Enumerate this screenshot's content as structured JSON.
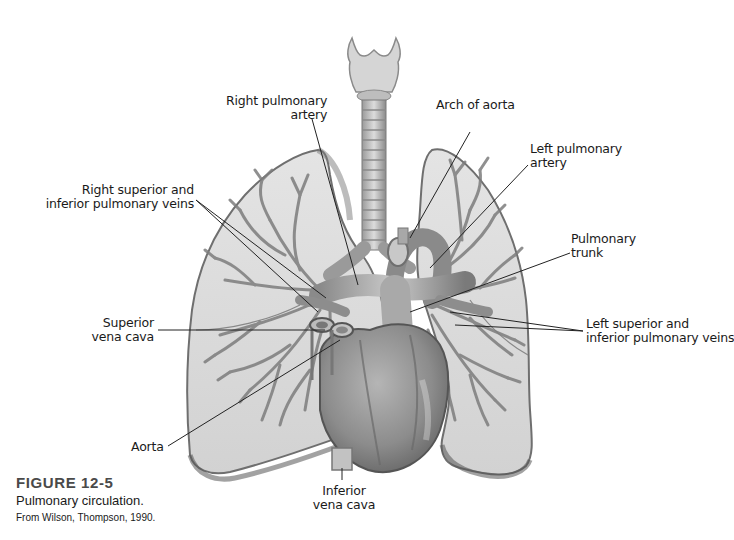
{
  "figure": {
    "number": "FIGURE 12-5",
    "title": "Pulmonary circulation.",
    "credit": "From Wilson, Thompson, 1990."
  },
  "labels": {
    "right_pulmonary_artery": {
      "line1": "Right pulmonary",
      "line2": "artery"
    },
    "arch_of_aorta": {
      "line1": "Arch of aorta"
    },
    "left_pulmonary_artery": {
      "line1": "Left pulmonary",
      "line2": "artery"
    },
    "right_pulmonary_veins": {
      "line1": "Right superior and",
      "line2": "inferior pulmonary veins"
    },
    "pulmonary_trunk": {
      "line1": "Pulmonary",
      "line2": "trunk"
    },
    "superior_vena_cava": {
      "line1": "Superior",
      "line2": "vena cava"
    },
    "left_pulmonary_veins": {
      "line1": "Left superior and",
      "line2": "inferior pulmonary veins"
    },
    "aorta": {
      "line1": "Aorta"
    },
    "inferior_vena_cava": {
      "line1": "Inferior",
      "line2": "vena cava"
    }
  },
  "colors": {
    "lung_fill": "#d9d9d9",
    "lung_edge": "#8a8a8a",
    "vessel": "#7a7a7a",
    "heart": "#8f8f8f",
    "leader_line": "#222222",
    "caption_heading": "#4a4a4a"
  }
}
